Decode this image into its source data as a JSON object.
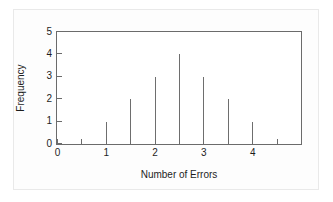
{
  "chart_data": {
    "type": "bar",
    "title": "",
    "xlabel": "Number of Errors",
    "ylabel": "Frequency",
    "x": [
      1,
      1.5,
      2,
      2.5,
      3,
      3.5,
      4
    ],
    "values": [
      1,
      2,
      3,
      4,
      3,
      2,
      1
    ],
    "xlim": [
      0,
      5
    ],
    "ylim": [
      0,
      5
    ],
    "x_tick_labels": [
      "0",
      "1",
      "2",
      "3",
      "4"
    ],
    "x_tick_values": [
      0,
      1,
      2,
      3,
      4
    ],
    "x_minor_tick_values": [
      0.5,
      1.5,
      2.5,
      3.5,
      4.5
    ],
    "y_tick_labels": [
      "0",
      "1",
      "2",
      "3",
      "4",
      "5"
    ],
    "y_tick_values": [
      0,
      1,
      2,
      3,
      4,
      5
    ],
    "grid": false,
    "legend": null,
    "series_color": "#6e6e6e",
    "axis_color": "#6b6b6b",
    "background_color": "#ffffff"
  }
}
